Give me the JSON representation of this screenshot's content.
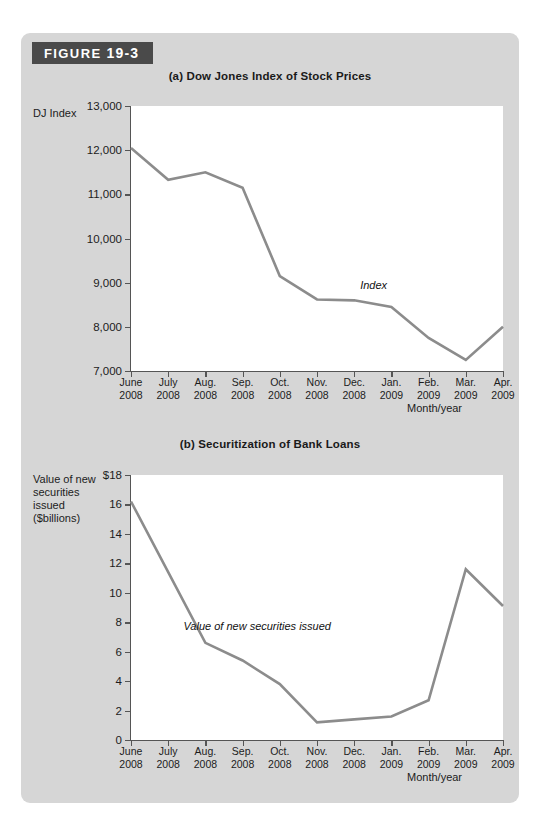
{
  "figure": {
    "badge_prefix": "FIGURE",
    "badge_number": "19-3"
  },
  "panel_a": {
    "title": "(a) Dow Jones Index of Stock Prices",
    "y_axis_title": "DJ Index",
    "x_axis_caption": "Month/year",
    "series_label": "Index"
  },
  "panel_b": {
    "title": "(b) Securitization of Bank Loans",
    "y_axis_title_line1": "Value of new",
    "y_axis_title_line2": "securities",
    "y_axis_title_line3": "issued",
    "y_axis_title_line4": "($billions)",
    "x_axis_caption": "Month/year",
    "series_label": "Value of new securities issued"
  },
  "colors": {
    "panel_background": "#d6d6d6",
    "badge_background": "#4a4a4a",
    "badge_text": "#ffffff",
    "plot_background": "#ffffff",
    "series_line": "#8c8c8c",
    "axis": "#555555"
  },
  "chart_data": [
    {
      "type": "line",
      "id": "a",
      "title": "(a) Dow Jones Index of Stock Prices",
      "xlabel": "Month/year",
      "ylabel": "DJ Index",
      "ylim": [
        7000,
        13000
      ],
      "yticks": [
        7000,
        8000,
        9000,
        10000,
        11000,
        12000,
        13000
      ],
      "ytick_labels": [
        "7,000",
        "8,000",
        "9,000",
        "10,000",
        "11,000",
        "12,000",
        "13,000"
      ],
      "grid": false,
      "legend": "none",
      "annotations": [
        {
          "text": "Index",
          "x": "Dec. 2008",
          "y": 8900
        }
      ],
      "categories": [
        "June 2008",
        "July 2008",
        "Aug. 2008",
        "Sep. 2008",
        "Oct. 2008",
        "Nov. 2008",
        "Dec. 2008",
        "Jan. 2009",
        "Feb. 2009",
        "Mar. 2009",
        "Apr. 2009"
      ],
      "xtick_labels": [
        [
          "June",
          "2008"
        ],
        [
          "July",
          "2008"
        ],
        [
          "Aug.",
          "2008"
        ],
        [
          "Sep.",
          "2008"
        ],
        [
          "Oct.",
          "2008"
        ],
        [
          "Nov.",
          "2008"
        ],
        [
          "Dec.",
          "2008"
        ],
        [
          "Jan.",
          "2009"
        ],
        [
          "Feb.",
          "2009"
        ],
        [
          "Mar.",
          "2009"
        ],
        [
          "Apr.",
          "2009"
        ]
      ],
      "series": [
        {
          "name": "Index",
          "values": [
            12050,
            11330,
            11500,
            11150,
            9150,
            8620,
            8600,
            8450,
            7750,
            7250,
            8000
          ]
        }
      ]
    },
    {
      "type": "line",
      "id": "b",
      "title": "(b) Securitization of Bank Loans",
      "xlabel": "Month/year",
      "ylabel": "Value of new securities issued ($billions)",
      "ylim": [
        0,
        18
      ],
      "yticks": [
        0,
        2,
        4,
        6,
        8,
        10,
        12,
        14,
        16,
        18
      ],
      "ytick_labels": [
        "0",
        "2",
        "4",
        "6",
        "8",
        "10",
        "12",
        "14",
        "16",
        "$18"
      ],
      "grid": false,
      "legend": "none",
      "annotations": [
        {
          "text": "Value of new securities issued",
          "x": "Aug. 2008",
          "y": 7.6
        }
      ],
      "categories": [
        "June 2008",
        "July 2008",
        "Aug. 2008",
        "Sep. 2008",
        "Oct. 2008",
        "Nov. 2008",
        "Dec. 2008",
        "Jan. 2009",
        "Feb. 2009",
        "Mar. 2009",
        "Apr. 2009"
      ],
      "xtick_labels": [
        [
          "June",
          "2008"
        ],
        [
          "July",
          "2008"
        ],
        [
          "Aug.",
          "2008"
        ],
        [
          "Sep.",
          "2008"
        ],
        [
          "Oct.",
          "2008"
        ],
        [
          "Nov.",
          "2008"
        ],
        [
          "Dec.",
          "2008"
        ],
        [
          "Jan.",
          "2009"
        ],
        [
          "Feb.",
          "2009"
        ],
        [
          "Mar.",
          "2009"
        ],
        [
          "Apr.",
          "2009"
        ]
      ],
      "series": [
        {
          "name": "Value of new securities issued",
          "values": [
            16.2,
            11.4,
            6.6,
            5.4,
            3.8,
            1.2,
            1.4,
            1.6,
            2.7,
            11.6,
            9.1
          ]
        }
      ]
    }
  ]
}
